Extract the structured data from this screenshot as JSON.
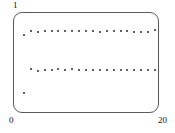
{
  "figure": {
    "background_color": "#ffffff",
    "frame_color": "#5a5a5a",
    "point_color": "#2b2b2b"
  },
  "labels": {
    "y_max": "1",
    "y_min": "0",
    "x_max": "20"
  },
  "chart_data": {
    "type": "scatter",
    "title": "",
    "subtitle": "",
    "xlabel": "",
    "ylabel": "",
    "xlim": [
      0,
      20
    ],
    "ylim": [
      0,
      1
    ],
    "grid": false,
    "legend": null,
    "xticks": [
      "0",
      "20"
    ],
    "yticks": [
      "0",
      "1"
    ],
    "x": [
      1,
      2,
      3,
      4,
      5,
      6,
      7,
      8,
      9,
      10,
      11,
      12,
      13,
      14,
      15,
      16,
      17,
      18,
      19,
      20
    ],
    "series": [
      {
        "name": "upper-series",
        "marker": "dot",
        "values": [
          0.79,
          0.83,
          0.82,
          0.83,
          0.83,
          0.83,
          0.83,
          0.83,
          0.83,
          0.83,
          0.83,
          0.82,
          0.83,
          0.83,
          0.83,
          0.83,
          0.82,
          0.82,
          0.82,
          0.84
        ]
      },
      {
        "name": "lower-series",
        "marker": "dot",
        "values": [
          0.18,
          0.43,
          0.41,
          0.42,
          0.42,
          0.43,
          0.42,
          0.43,
          0.42,
          0.42,
          0.42,
          0.42,
          0.42,
          0.42,
          0.42,
          0.42,
          0.42,
          0.42,
          0.42,
          0.42
        ]
      }
    ],
    "annotations": []
  }
}
